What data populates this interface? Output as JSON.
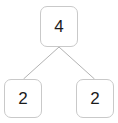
{
  "diagram": {
    "type": "binary-tree",
    "title": "",
    "background_color": "#ffffff",
    "node_border_color": "#c9c9c9",
    "node_fill_color": "#ffffff",
    "node_text_color": "#1b1b1b",
    "edge_color": "#b3b3b3",
    "nodes": [
      {
        "id": "root",
        "label": "4",
        "role": "parent"
      },
      {
        "id": "left",
        "label": "2",
        "role": "child"
      },
      {
        "id": "right",
        "label": "2",
        "role": "child"
      }
    ],
    "edges": [
      {
        "from": "root",
        "to": "left"
      },
      {
        "from": "root",
        "to": "right"
      }
    ]
  }
}
